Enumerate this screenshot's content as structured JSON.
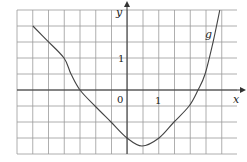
{
  "chart_data": {
    "type": "line",
    "title": "",
    "xlabel": "x",
    "ylabel": "y",
    "xlim": [
      -3.5,
      3.4
    ],
    "ylim": [
      -2.0,
      2.5
    ],
    "grid": true,
    "grid_step": 0.5,
    "tick_labels": {
      "origin": "0",
      "x": "1",
      "y": "1"
    },
    "series": [
      {
        "name": "g",
        "x": [
          -2.94,
          -2.5,
          -1.97,
          -1.75,
          -1.47,
          -1.0,
          -0.5,
          0.0,
          0.47,
          1.0,
          1.47,
          1.94,
          2.22,
          2.44,
          2.69,
          2.9
        ],
        "y": [
          2.0,
          1.55,
          1.0,
          0.5,
          0.0,
          -0.5,
          -1.0,
          -1.5,
          -1.75,
          -1.5,
          -1.0,
          -0.5,
          0.0,
          0.5,
          1.5,
          2.5
        ]
      }
    ],
    "legend": [],
    "annotations": [
      "g"
    ]
  },
  "labels": {
    "x_axis": "x",
    "y_axis": "y",
    "origin": "0",
    "x_tick": "1",
    "y_tick": "1",
    "curve": "g"
  },
  "colors": {
    "grid": "#9a9a9a",
    "axis": "#333333",
    "curve": "#444444"
  }
}
